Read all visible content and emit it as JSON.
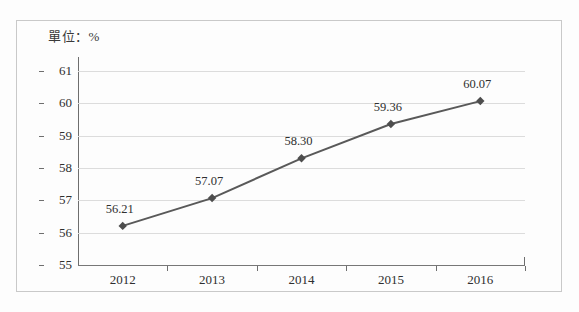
{
  "figure": {
    "unit_caption": "單位：%",
    "border_color": "#c9c9c9",
    "background_color": "#fdfdfd"
  },
  "chart_data": {
    "type": "line",
    "title": "",
    "subtitle": "",
    "unit_note": "單位：%",
    "categories": [
      "2012",
      "2013",
      "2014",
      "2015",
      "2016"
    ],
    "values": [
      56.21,
      57.07,
      58.3,
      59.36,
      60.07
    ],
    "point_labels": [
      "56.21",
      "57.07",
      "58.30",
      "59.36",
      "60.07"
    ],
    "series": [
      {
        "name": "",
        "values": [
          56.21,
          57.07,
          58.3,
          59.36,
          60.07
        ],
        "line_color": "#595959",
        "marker": "diamond",
        "marker_color": "#4d4d4d"
      }
    ],
    "xlabel": "",
    "ylabel": "",
    "ylim": [
      55,
      61
    ],
    "yticks": [
      55,
      56,
      57,
      58,
      59,
      60,
      61
    ],
    "ytick_labels": [
      "55",
      "56",
      "57",
      "58",
      "59",
      "60",
      "61"
    ],
    "grid": true,
    "grid_color": "#dcdcdc",
    "axis_color": "#6e6e6e",
    "legend": false,
    "legend_position": "none"
  }
}
